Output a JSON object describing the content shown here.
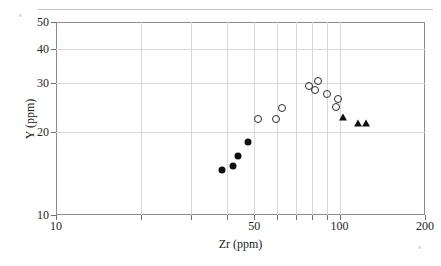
{
  "figure": {
    "caption_fragment": "",
    "background": "#ffffff"
  },
  "axes": {
    "x": {
      "title": "Zr (ppm)",
      "scale": "log",
      "min": 10,
      "max": 200,
      "ticks_labeled": [
        10,
        50,
        100,
        200
      ],
      "tick_labels": [
        "10",
        "50",
        "100",
        "200"
      ],
      "minor_ticks": [
        20,
        30,
        40,
        50,
        60,
        70,
        80,
        90,
        100
      ]
    },
    "y": {
      "title": "Y (ppm)",
      "scale": "log",
      "min": 10,
      "max": 50,
      "ticks_labeled": [
        10,
        20,
        30,
        40,
        50
      ],
      "tick_labels": [
        "10",
        "20",
        "30",
        "40",
        "50"
      ]
    }
  },
  "chart_data": {
    "type": "scatter",
    "title": "",
    "xlabel": "Zr (ppm)",
    "ylabel": "Y (ppm)",
    "xscale": "log",
    "yscale": "log",
    "xlim": [
      10,
      200
    ],
    "ylim": [
      10,
      50
    ],
    "xticks": [
      10,
      50,
      100,
      200
    ],
    "yticks": [
      10,
      20,
      30,
      40,
      50
    ],
    "grid": true,
    "legend": "none",
    "series": [
      {
        "name": "filled-circles",
        "marker": "filled-circle",
        "color": "#101010",
        "points": [
          {
            "x": 38.5,
            "y": 14.6
          },
          {
            "x": 42.0,
            "y": 15.1
          },
          {
            "x": 44.0,
            "y": 16.4
          },
          {
            "x": 47.5,
            "y": 18.4
          }
        ]
      },
      {
        "name": "open-circles",
        "marker": "open-circle",
        "color": "#2b2b2b",
        "points": [
          {
            "x": 51.5,
            "y": 22.2
          },
          {
            "x": 59.5,
            "y": 22.2
          },
          {
            "x": 62.5,
            "y": 24.4
          },
          {
            "x": 78.0,
            "y": 29.2
          },
          {
            "x": 82.0,
            "y": 28.4
          },
          {
            "x": 84.0,
            "y": 30.5
          },
          {
            "x": 90.5,
            "y": 27.5
          },
          {
            "x": 98.5,
            "y": 26.3
          },
          {
            "x": 97.0,
            "y": 24.6
          }
        ]
      },
      {
        "name": "filled-triangles",
        "marker": "filled-triangle",
        "color": "#101010",
        "points": [
          {
            "x": 103.0,
            "y": 22.6
          },
          {
            "x": 116.0,
            "y": 21.6
          },
          {
            "x": 124.0,
            "y": 21.6
          }
        ]
      }
    ]
  }
}
